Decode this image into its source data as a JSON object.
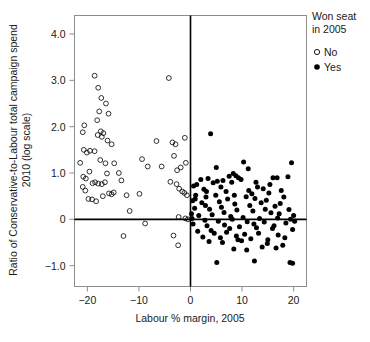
{
  "chart_data": {
    "type": "scatter",
    "title": "",
    "xlabel": "Labour % margin, 2005",
    "ylabel": "Ratio of Conservative-to-Labour total campaign spend 2010 (log scale)",
    "ylabel_line1": "Ratio of Conservative-to-Labour total campaign spend",
    "ylabel_line2": "2010 (log scale)",
    "xlim": [
      -22.5,
      22.5
    ],
    "ylim": [
      -1.45,
      4.4
    ],
    "xticks": [
      -20,
      -10,
      0,
      10,
      20
    ],
    "xtick_labels": [
      "−20",
      "−10",
      "0",
      "10",
      "20"
    ],
    "yticks": [
      4.0,
      3.0,
      2.0,
      1.0,
      0,
      -1.0
    ],
    "ytick_labels": [
      "4.0",
      "3.0",
      "2.0",
      "1.0",
      "0",
      "−1.0"
    ],
    "grid": false,
    "reference_lines": [
      {
        "orientation": "horizontal",
        "value": 0
      },
      {
        "orientation": "vertical",
        "value": 0
      }
    ],
    "legend": {
      "title_line1": "Won seat",
      "title_line2": "in 2005",
      "position": "top-right-outside",
      "entries": [
        {
          "label": "No",
          "marker": "open-circle"
        },
        {
          "label": "Yes",
          "marker": "filled-circle"
        }
      ]
    },
    "series": [
      {
        "name": "No",
        "marker": "open-circle",
        "color": "#000000",
        "points": [
          [
            -18.6,
            3.1
          ],
          [
            -4.2,
            3.05
          ],
          [
            -17.9,
            2.84
          ],
          [
            -17.3,
            2.62
          ],
          [
            -16.4,
            2.5
          ],
          [
            -17.7,
            2.33
          ],
          [
            -18.1,
            2.14
          ],
          [
            -15.9,
            2.28
          ],
          [
            -20.6,
            2.03
          ],
          [
            -20.9,
            1.88
          ],
          [
            -18.0,
            1.82
          ],
          [
            -17.4,
            1.9
          ],
          [
            -17.2,
            1.78
          ],
          [
            -16.9,
            1.86
          ],
          [
            -16.1,
            1.7
          ],
          [
            -15.3,
            1.62
          ],
          [
            -6.6,
            1.69
          ],
          [
            -3.5,
            1.66
          ],
          [
            -2.9,
            1.62
          ],
          [
            -1.1,
            1.76
          ],
          [
            -20.7,
            1.5
          ],
          [
            -20.1,
            1.44
          ],
          [
            -19.5,
            1.48
          ],
          [
            -18.6,
            1.47
          ],
          [
            -17.5,
            1.28
          ],
          [
            -9.4,
            1.3
          ],
          [
            -8.3,
            1.14
          ],
          [
            -5.6,
            1.14
          ],
          [
            -3.2,
            1.37
          ],
          [
            -21.4,
            1.22
          ],
          [
            -16.5,
            1.21
          ],
          [
            -14.8,
            1.21
          ],
          [
            -13.9,
            1.0
          ],
          [
            -13.4,
            0.84
          ],
          [
            -2.6,
            1.06
          ],
          [
            -0.9,
            1.22
          ],
          [
            -20.8,
            0.92
          ],
          [
            -20.3,
            0.88
          ],
          [
            -19.0,
            0.78
          ],
          [
            -18.5,
            0.8
          ],
          [
            -17.9,
            0.77
          ],
          [
            -17.2,
            0.76
          ],
          [
            -16.6,
            0.8
          ],
          [
            -15.8,
            0.56
          ],
          [
            -15.3,
            0.54
          ],
          [
            -14.9,
            0.58
          ],
          [
            -3.9,
            0.81
          ],
          [
            -2.7,
            0.76
          ],
          [
            -2.2,
            0.66
          ],
          [
            -1.6,
            0.6
          ],
          [
            -1.2,
            0.57
          ],
          [
            -0.7,
            0.52
          ],
          [
            -20.9,
            0.7
          ],
          [
            -20.4,
            0.62
          ],
          [
            -19.8,
            0.44
          ],
          [
            -19.1,
            0.43
          ],
          [
            -18.3,
            0.39
          ],
          [
            -17.0,
            0.5
          ],
          [
            -12.4,
            0.52
          ],
          [
            -9.9,
            0.55
          ],
          [
            -11.8,
            0.18
          ],
          [
            -8.8,
            -0.09
          ],
          [
            -2.3,
            0.05
          ],
          [
            -1.0,
            0.02
          ],
          [
            -0.5,
            0.0
          ],
          [
            -13.0,
            -0.36
          ],
          [
            -3.3,
            -0.35
          ],
          [
            -2.4,
            -0.56
          ],
          [
            -19.6,
            1.03
          ],
          [
            -16.2,
            0.99
          ],
          [
            -1.9,
            1.12
          ]
        ]
      },
      {
        "name": "Yes",
        "marker": "filled-circle",
        "color": "#000000",
        "points": [
          [
            3.9,
            1.85
          ],
          [
            10.3,
            1.24
          ],
          [
            19.6,
            1.22
          ],
          [
            5.0,
            1.12
          ],
          [
            11.2,
            1.09
          ],
          [
            18.9,
            0.92
          ],
          [
            8.3,
            0.99
          ],
          [
            8.8,
            0.94
          ],
          [
            9.3,
            0.9
          ],
          [
            16.0,
            0.9
          ],
          [
            16.8,
            0.9
          ],
          [
            7.5,
            0.93
          ],
          [
            2.0,
            0.86
          ],
          [
            3.4,
            0.88
          ],
          [
            6.3,
            0.84
          ],
          [
            1.2,
            0.75
          ],
          [
            4.4,
            0.79
          ],
          [
            5.2,
            0.82
          ],
          [
            8.0,
            0.8
          ],
          [
            9.8,
            0.86
          ],
          [
            13.0,
            0.7
          ],
          [
            14.1,
            0.66
          ],
          [
            0.6,
            0.72
          ],
          [
            2.6,
            0.65
          ],
          [
            6.9,
            0.6
          ],
          [
            11.9,
            0.55
          ],
          [
            15.2,
            0.57
          ],
          [
            17.6,
            0.62
          ],
          [
            1.0,
            0.52
          ],
          [
            3.0,
            0.48
          ],
          [
            4.9,
            0.52
          ],
          [
            7.2,
            0.44
          ],
          [
            10.8,
            0.49
          ],
          [
            12.5,
            0.45
          ],
          [
            14.7,
            0.41
          ],
          [
            18.1,
            0.48
          ],
          [
            0.4,
            0.4
          ],
          [
            2.2,
            0.36
          ],
          [
            5.6,
            0.38
          ],
          [
            8.6,
            0.33
          ],
          [
            11.5,
            0.3
          ],
          [
            13.7,
            0.36
          ],
          [
            16.4,
            0.28
          ],
          [
            19.1,
            0.21
          ],
          [
            0.8,
            0.24
          ],
          [
            3.7,
            0.22
          ],
          [
            6.0,
            0.26
          ],
          [
            9.0,
            0.2
          ],
          [
            12.1,
            0.18
          ],
          [
            15.6,
            0.14
          ],
          [
            17.2,
            0.12
          ],
          [
            20.0,
            0.08
          ],
          [
            0.2,
            0.12
          ],
          [
            1.6,
            0.08
          ],
          [
            4.2,
            0.1
          ],
          [
            7.8,
            0.06
          ],
          [
            10.2,
            0.04
          ],
          [
            13.4,
            0.02
          ],
          [
            16.9,
            0.03
          ],
          [
            19.4,
            0.0
          ],
          [
            0.3,
            0.02
          ],
          [
            2.8,
            -0.02
          ],
          [
            5.4,
            -0.04
          ],
          [
            8.1,
            0.0
          ],
          [
            11.0,
            -0.05
          ],
          [
            14.3,
            -0.06
          ],
          [
            18.5,
            -0.08
          ],
          [
            0.5,
            -0.1
          ],
          [
            3.2,
            -0.14
          ],
          [
            6.6,
            -0.12
          ],
          [
            9.5,
            -0.16
          ],
          [
            12.8,
            -0.18
          ],
          [
            15.9,
            -0.2
          ],
          [
            19.8,
            -0.22
          ],
          [
            1.4,
            -0.26
          ],
          [
            4.0,
            -0.24
          ],
          [
            7.0,
            -0.28
          ],
          [
            10.5,
            -0.32
          ],
          [
            13.2,
            -0.3
          ],
          [
            17.0,
            -0.34
          ],
          [
            2.4,
            -0.38
          ],
          [
            5.8,
            -0.4
          ],
          [
            8.9,
            -0.36
          ],
          [
            11.7,
            -0.42
          ],
          [
            15.0,
            -0.44
          ],
          [
            18.3,
            -0.4
          ],
          [
            3.6,
            -0.48
          ],
          [
            6.2,
            -0.5
          ],
          [
            9.9,
            -0.46
          ],
          [
            14.9,
            -0.52
          ],
          [
            17.9,
            -0.56
          ],
          [
            4.6,
            -0.3
          ],
          [
            7.6,
            -0.2
          ],
          [
            12.3,
            -0.1
          ],
          [
            16.2,
            -0.14
          ],
          [
            20.2,
            -0.04
          ],
          [
            5.1,
            -0.93
          ],
          [
            12.4,
            -0.9
          ],
          [
            19.3,
            -0.93
          ],
          [
            19.8,
            -0.95
          ],
          [
            8.4,
            -0.64
          ],
          [
            10.9,
            -0.66
          ],
          [
            13.9,
            -0.6
          ],
          [
            16.6,
            -0.62
          ],
          [
            2.9,
            0.3
          ],
          [
            6.5,
            0.15
          ],
          [
            9.2,
            -0.44
          ],
          [
            11.3,
            0.62
          ],
          [
            14.5,
            0.22
          ],
          [
            17.4,
            0.34
          ],
          [
            0.9,
            0.44
          ],
          [
            3.1,
            0.6
          ],
          [
            5.9,
            0.7
          ],
          [
            8.5,
            0.52
          ],
          [
            12.7,
            0.8
          ],
          [
            15.4,
            0.75
          ]
        ]
      }
    ]
  }
}
